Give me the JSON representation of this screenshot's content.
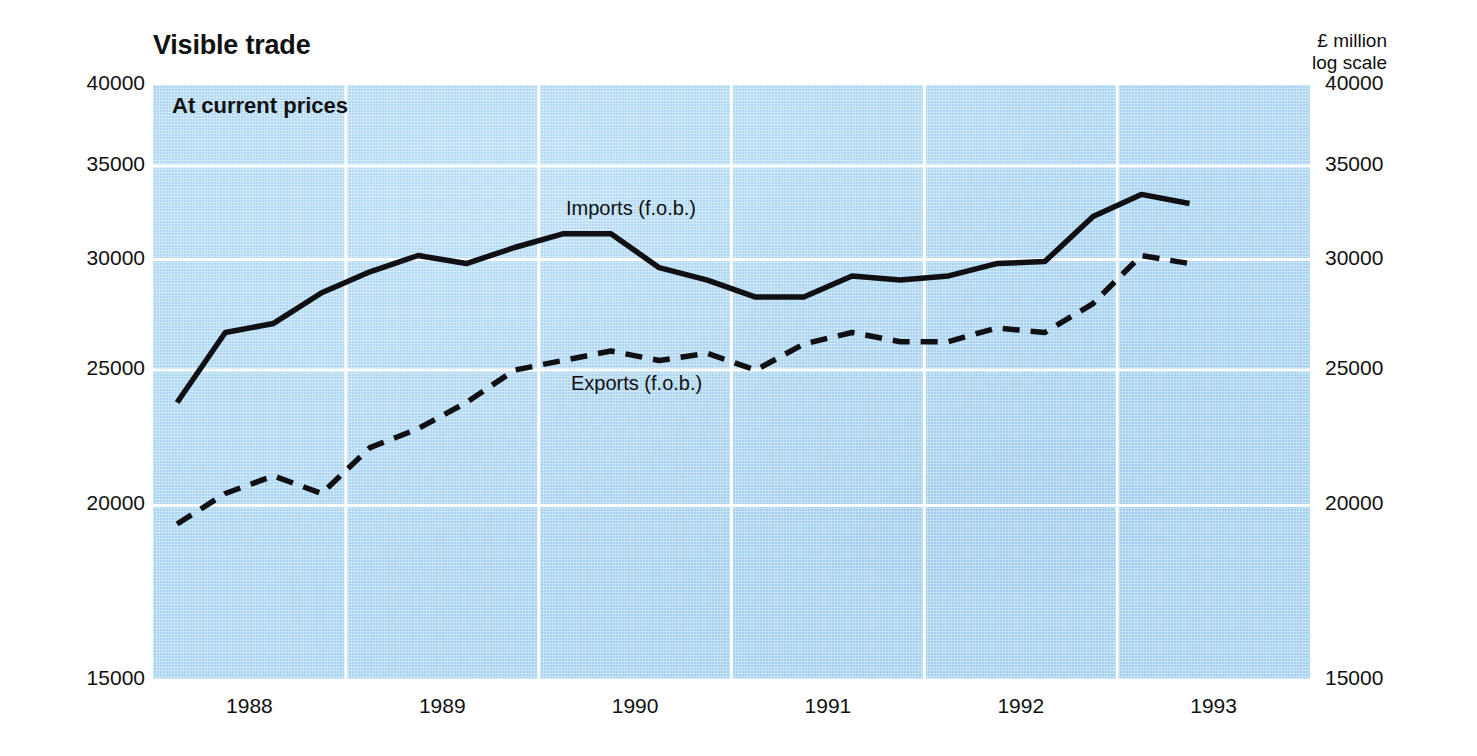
{
  "chart_title": "Visible trade",
  "subtitle": "At current prices",
  "units": {
    "currency_line": "£ million",
    "scale_line": "log scale"
  },
  "axis": {
    "y_ticks": [
      "40000",
      "35000",
      "30000",
      "25000",
      "20000",
      "15000"
    ],
    "x_ticks": [
      "1988",
      "1989",
      "1990",
      "1991",
      "1992",
      "1993"
    ]
  },
  "labels": {
    "imports": "Imports (f.o.b.)",
    "exports": "Exports (f.o.b.)"
  },
  "colors": {
    "plot_background": "#a9d5f2",
    "gridline": "#ffffff",
    "series_line": "#101014",
    "page_background": "#ffffff",
    "text": "#111111"
  },
  "chart_data": {
    "type": "line",
    "title": "Visible trade",
    "subtitle": "At current prices",
    "xlabel": "",
    "ylabel": "£ million",
    "scale": "log",
    "ylim": [
      15000,
      40000
    ],
    "ytick_values": [
      40000,
      35000,
      30000,
      25000,
      20000,
      15000
    ],
    "grid": true,
    "legend_position": "inline-annotation",
    "x_unit": "quarter",
    "x": [
      "1988 Q1",
      "1988 Q2",
      "1988 Q3",
      "1988 Q4",
      "1989 Q1",
      "1989 Q2",
      "1989 Q3",
      "1989 Q4",
      "1990 Q1",
      "1990 Q2",
      "1990 Q3",
      "1990 Q4",
      "1991 Q1",
      "1991 Q2",
      "1991 Q3",
      "1991 Q4",
      "1992 Q1",
      "1992 Q2",
      "1992 Q3",
      "1992 Q4",
      "1993 Q1",
      "1993 Q2"
    ],
    "series": [
      {
        "name": "Imports (f.o.b.)",
        "style": "solid",
        "values": [
          23700,
          26600,
          27000,
          28400,
          29400,
          30200,
          29800,
          30600,
          31300,
          31300,
          29600,
          29000,
          28200,
          28200,
          29200,
          29000,
          29200,
          29800,
          29900,
          32200,
          33400,
          32900
        ]
      },
      {
        "name": "Exports (f.o.b.)",
        "style": "dashed",
        "values": [
          19400,
          20400,
          21000,
          20400,
          22000,
          22700,
          23700,
          25000,
          25400,
          25800,
          25400,
          25700,
          25000,
          26100,
          26600,
          26200,
          26200,
          26800,
          26600,
          27900,
          30200,
          29800
        ]
      }
    ],
    "series_end_values": {
      "imports": 33500,
      "exports": 30800
    }
  }
}
